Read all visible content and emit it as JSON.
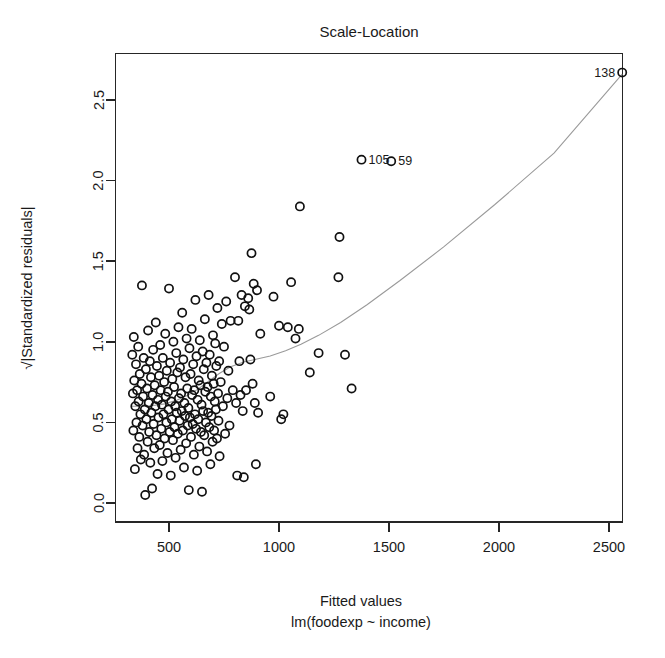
{
  "chart_data": {
    "type": "scatter",
    "title": "Scale-Location",
    "xlabel": "Fitted values",
    "sublabel": "lm(foodexp ~ income)",
    "ylabel": "√|Standardized residuals|",
    "xlim": [
      300,
      2620
    ],
    "ylim": [
      -0.04,
      2.76
    ],
    "grid": false,
    "legend": null,
    "xticks": [
      500,
      1000,
      1500,
      2000,
      2500
    ],
    "xtick_labels": [
      "500",
      "1000",
      "1500",
      "2000",
      "2500"
    ],
    "yticks": [
      0.0,
      0.5,
      1.0,
      1.5,
      2.0,
      2.5
    ],
    "ytick_labels": [
      "0.0",
      "0.5",
      "1.0",
      "1.5",
      "2.0",
      "2.5"
    ],
    "marker": "open-circle",
    "marker_radius_px": 4.1,
    "point_color": "#111111",
    "smoother_color": "#9a9a9a",
    "annotations": [
      {
        "label": "138",
        "x": 2560,
        "y": 2.67,
        "side": "left"
      },
      {
        "label": "105",
        "x": 1375,
        "y": 2.13,
        "side": "right"
      },
      {
        "label": "59",
        "x": 1510,
        "y": 2.12,
        "side": "right"
      }
    ],
    "smoother": {
      "name": "lowess",
      "x": [
        330,
        380,
        430,
        480,
        530,
        580,
        630,
        680,
        730,
        780,
        840,
        900,
        960,
        1030,
        1100,
        1180,
        1280,
        1400,
        1550,
        1750,
        1980,
        2250,
        2560
      ],
      "y": [
        0.6,
        0.6,
        0.605,
        0.615,
        0.635,
        0.665,
        0.705,
        0.755,
        0.805,
        0.845,
        0.875,
        0.893,
        0.912,
        0.945,
        0.985,
        1.04,
        1.12,
        1.23,
        1.38,
        1.59,
        1.85,
        2.17,
        2.66
      ]
    },
    "points": [
      [
        333,
        0.92
      ],
      [
        336,
        0.68
      ],
      [
        338,
        0.45
      ],
      [
        340,
        1.03
      ],
      [
        342,
        0.76
      ],
      [
        345,
        0.21
      ],
      [
        347,
        0.6
      ],
      [
        350,
        0.86
      ],
      [
        352,
        0.5
      ],
      [
        355,
        0.7
      ],
      [
        357,
        0.34
      ],
      [
        360,
        0.97
      ],
      [
        362,
        0.63
      ],
      [
        365,
        0.41
      ],
      [
        367,
        0.8
      ],
      [
        370,
        0.55
      ],
      [
        372,
        0.27
      ],
      [
        375,
        0.74
      ],
      [
        377,
        1.35
      ],
      [
        380,
        0.48
      ],
      [
        382,
        0.66
      ],
      [
        385,
        0.9
      ],
      [
        387,
        0.3
      ],
      [
        390,
        0.58
      ],
      [
        392,
        0.05
      ],
      [
        395,
        0.83
      ],
      [
        397,
        0.52
      ],
      [
        400,
        0.71
      ],
      [
        403,
        0.38
      ],
      [
        405,
        1.07
      ],
      [
        408,
        0.62
      ],
      [
        410,
        0.44
      ],
      [
        413,
        0.88
      ],
      [
        415,
        0.25
      ],
      [
        418,
        0.78
      ],
      [
        420,
        0.56
      ],
      [
        423,
        0.09
      ],
      [
        425,
        0.67
      ],
      [
        428,
        0.95
      ],
      [
        430,
        0.49
      ],
      [
        433,
        0.34
      ],
      [
        435,
        0.73
      ],
      [
        438,
        0.6
      ],
      [
        440,
        1.12
      ],
      [
        443,
        0.42
      ],
      [
        445,
        0.85
      ],
      [
        448,
        0.18
      ],
      [
        450,
        0.64
      ],
      [
        452,
        0.53
      ],
      [
        455,
        0.79
      ],
      [
        458,
        0.36
      ],
      [
        460,
        0.98
      ],
      [
        462,
        0.7
      ],
      [
        465,
        0.46
      ],
      [
        468,
        0.61
      ],
      [
        470,
        0.26
      ],
      [
        472,
        0.9
      ],
      [
        475,
        0.55
      ],
      [
        478,
        0.75
      ],
      [
        480,
        0.4
      ],
      [
        483,
        1.05
      ],
      [
        485,
        0.66
      ],
      [
        488,
        0.5
      ],
      [
        490,
        0.82
      ],
      [
        493,
        0.31
      ],
      [
        495,
        0.69
      ],
      [
        498,
        0.58
      ],
      [
        500,
        1.33
      ],
      [
        503,
        0.44
      ],
      [
        505,
        0.87
      ],
      [
        508,
        0.17
      ],
      [
        510,
        0.63
      ],
      [
        513,
        0.52
      ],
      [
        515,
        0.77
      ],
      [
        518,
        0.39
      ],
      [
        520,
        1.0
      ],
      [
        523,
        0.72
      ],
      [
        525,
        0.47
      ],
      [
        528,
        0.6
      ],
      [
        530,
        0.28
      ],
      [
        533,
        0.93
      ],
      [
        535,
        0.56
      ],
      [
        538,
        0.81
      ],
      [
        540,
        0.43
      ],
      [
        543,
        1.09
      ],
      [
        545,
        0.65
      ],
      [
        548,
        0.51
      ],
      [
        550,
        0.84
      ],
      [
        553,
        0.33
      ],
      [
        555,
        0.68
      ],
      [
        558,
        0.57
      ],
      [
        560,
        1.18
      ],
      [
        563,
        0.45
      ],
      [
        565,
        0.89
      ],
      [
        568,
        0.22
      ],
      [
        570,
        0.62
      ],
      [
        573,
        0.54
      ],
      [
        575,
        0.78
      ],
      [
        578,
        0.37
      ],
      [
        580,
        1.02
      ],
      [
        583,
        0.71
      ],
      [
        585,
        0.48
      ],
      [
        588,
        0.59
      ],
      [
        590,
        0.08
      ],
      [
        593,
        0.96
      ],
      [
        595,
        0.53
      ],
      [
        598,
        0.8
      ],
      [
        600,
        0.41
      ],
      [
        603,
        1.08
      ],
      [
        605,
        0.67
      ],
      [
        608,
        0.49
      ],
      [
        610,
        0.86
      ],
      [
        613,
        0.3
      ],
      [
        615,
        0.7
      ],
      [
        618,
        0.55
      ],
      [
        620,
        1.26
      ],
      [
        623,
        0.46
      ],
      [
        625,
        0.91
      ],
      [
        628,
        0.2
      ],
      [
        630,
        0.64
      ],
      [
        633,
        0.52
      ],
      [
        635,
        0.76
      ],
      [
        638,
        0.35
      ],
      [
        640,
        1.01
      ],
      [
        643,
        0.73
      ],
      [
        645,
        0.44
      ],
      [
        648,
        0.61
      ],
      [
        650,
        0.07
      ],
      [
        653,
        0.94
      ],
      [
        655,
        0.57
      ],
      [
        658,
        0.83
      ],
      [
        660,
        0.42
      ],
      [
        663,
        1.14
      ],
      [
        665,
        0.69
      ],
      [
        668,
        0.5
      ],
      [
        670,
        0.87
      ],
      [
        673,
        0.32
      ],
      [
        675,
        0.72
      ],
      [
        678,
        0.56
      ],
      [
        680,
        1.29
      ],
      [
        683,
        0.47
      ],
      [
        685,
        0.92
      ],
      [
        688,
        0.24
      ],
      [
        690,
        0.66
      ],
      [
        693,
        0.54
      ],
      [
        695,
        0.79
      ],
      [
        698,
        0.38
      ],
      [
        700,
        1.04
      ],
      [
        703,
        0.74
      ],
      [
        705,
        0.45
      ],
      [
        708,
        0.63
      ],
      [
        710,
        0.99
      ],
      [
        713,
        0.58
      ],
      [
        715,
        0.85
      ],
      [
        718,
        0.4
      ],
      [
        720,
        1.21
      ],
      [
        723,
        0.68
      ],
      [
        725,
        0.51
      ],
      [
        728,
        0.88
      ],
      [
        730,
        0.29
      ],
      [
        735,
        0.75
      ],
      [
        740,
        1.11
      ],
      [
        745,
        0.6
      ],
      [
        750,
        0.97
      ],
      [
        755,
        0.43
      ],
      [
        760,
        1.25
      ],
      [
        765,
        0.65
      ],
      [
        770,
        0.82
      ],
      [
        775,
        0.48
      ],
      [
        780,
        1.13
      ],
      [
        790,
        0.7
      ],
      [
        800,
        1.4
      ],
      [
        805,
        0.62
      ],
      [
        810,
        0.17
      ],
      [
        815,
        1.13
      ],
      [
        820,
        0.88
      ],
      [
        825,
        0.67
      ],
      [
        830,
        1.29
      ],
      [
        835,
        0.57
      ],
      [
        840,
        0.16
      ],
      [
        845,
        1.22
      ],
      [
        850,
        0.7
      ],
      [
        860,
        1.27
      ],
      [
        865,
        1.2
      ],
      [
        870,
        0.89
      ],
      [
        875,
        1.55
      ],
      [
        880,
        0.74
      ],
      [
        885,
        1.36
      ],
      [
        890,
        0.62
      ],
      [
        895,
        0.24
      ],
      [
        900,
        1.32
      ],
      [
        905,
        0.56
      ],
      [
        915,
        1.05
      ],
      [
        960,
        0.66
      ],
      [
        975,
        1.28
      ],
      [
        1000,
        1.1
      ],
      [
        1010,
        0.52
      ],
      [
        1020,
        0.55
      ],
      [
        1040,
        1.09
      ],
      [
        1055,
        1.37
      ],
      [
        1075,
        1.02
      ],
      [
        1090,
        1.08
      ],
      [
        1095,
        1.84
      ],
      [
        1140,
        0.81
      ],
      [
        1180,
        0.93
      ],
      [
        1270,
        1.4
      ],
      [
        1275,
        1.65
      ],
      [
        1300,
        0.92
      ],
      [
        1330,
        0.71
      ],
      [
        1375,
        2.13
      ],
      [
        1510,
        2.12
      ],
      [
        2560,
        2.67
      ]
    ]
  }
}
